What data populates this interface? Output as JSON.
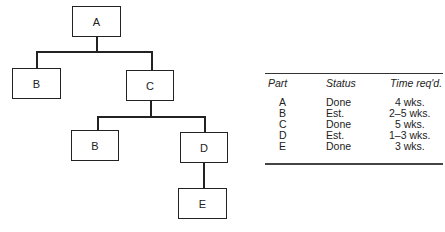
{
  "tree": {
    "nodes": [
      {
        "id": "A",
        "label": "A"
      },
      {
        "id": "B1",
        "label": "B"
      },
      {
        "id": "C",
        "label": "C"
      },
      {
        "id": "B2",
        "label": "B"
      },
      {
        "id": "D",
        "label": "D"
      },
      {
        "id": "E",
        "label": "E"
      }
    ],
    "edges": [
      [
        "A",
        "B1"
      ],
      [
        "A",
        "C"
      ],
      [
        "C",
        "B2"
      ],
      [
        "C",
        "D"
      ],
      [
        "D",
        "E"
      ]
    ]
  },
  "table": {
    "headers": [
      "Part",
      "Status",
      "Time req'd."
    ],
    "rows": [
      [
        "A",
        "Done",
        "4 wks."
      ],
      [
        "B",
        "Est.",
        "2–5 wks."
      ],
      [
        "C",
        "Done",
        "5 wks."
      ],
      [
        "D",
        "Est.",
        "1–3 wks."
      ],
      [
        "E",
        "Done",
        "3 wks."
      ]
    ]
  }
}
